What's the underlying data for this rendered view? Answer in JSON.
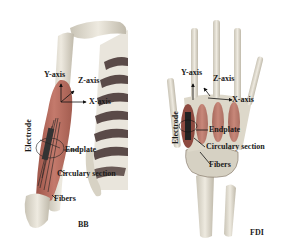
{
  "figure": {
    "panels": [
      {
        "id": "BB",
        "title": "BB",
        "labels": {
          "y_axis": "Y-axis",
          "z_axis": "Z-axis",
          "x_axis": "X-axis",
          "electrode": "Electrode",
          "endplate": "Endplate",
          "circular_section": "Circulary section",
          "fibers": "Fibers"
        }
      },
      {
        "id": "FDI",
        "title": "FDI",
        "labels": {
          "y_axis": "Y-axis",
          "z_axis": "Z-axis",
          "x_axis": "X-axis",
          "electrode": "Electrode",
          "endplate": "Endplate",
          "circular_section": "Circulary section",
          "fibers": "Fibers"
        }
      }
    ],
    "colors": {
      "bone": "#e6e2d6",
      "bone_shadow": "#b9b4a6",
      "muscle": "#b86a5e",
      "muscle_dark": "#8e4a40",
      "rib_dark": "#5a4a48",
      "annotation": "#111111"
    }
  }
}
